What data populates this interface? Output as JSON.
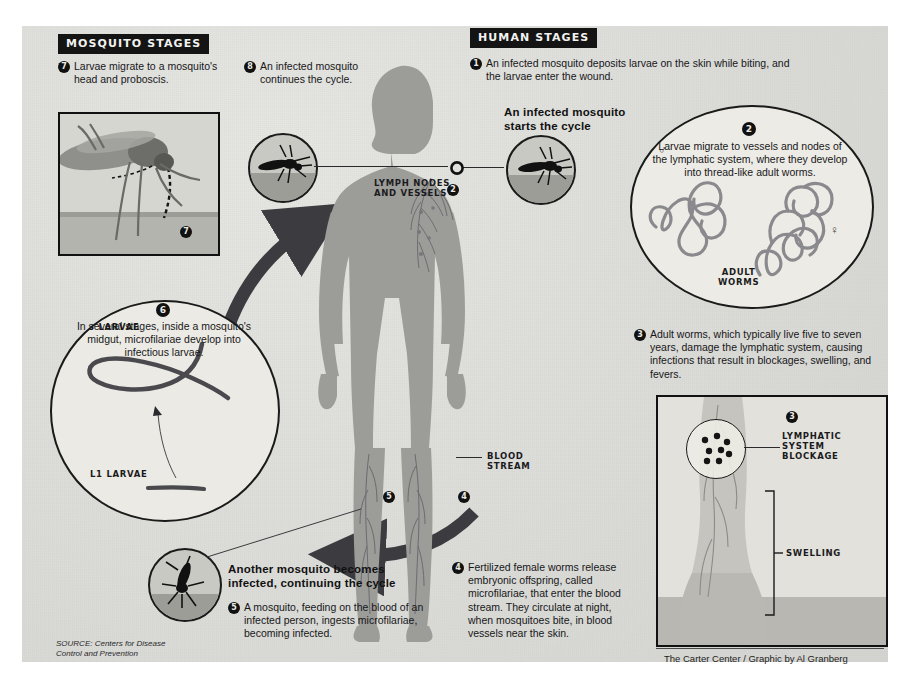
{
  "sections": {
    "mosquito": "MOSQUITO STAGES",
    "human": "HUMAN STAGES"
  },
  "steps": {
    "s1": {
      "num": "1",
      "text": "An infected mosquito deposits larvae on the skin while biting, and the larvae enter the wound."
    },
    "s2": {
      "num": "2",
      "text": "Larvae migrate to vessels and nodes of the lymphatic system, where they develop into thread-like adult worms."
    },
    "s3": {
      "num": "3",
      "text": "Adult worms, which typically live five to seven years, damage the lymphatic system, causing infections that result in blockages, swelling, and fevers."
    },
    "s4": {
      "num": "4",
      "text": "Fertilized female worms release embryonic offspring, called microfilariae, that enter the blood stream. They circulate at night, when mosquitoes bite, in blood vessels near the skin."
    },
    "s5": {
      "num": "5",
      "text": "A mosquito, feeding on the blood of an infected person, ingests microfilariae, becoming infected."
    },
    "s6": {
      "num": "6",
      "text": "In several stages, inside a mosquito's midgut, microfilariae develop into infectious larvae."
    },
    "s7": {
      "num": "7",
      "text": "Larvae migrate to a mosquito's head and proboscis."
    },
    "s8": {
      "num": "8",
      "text": "An infected mosquito continues the cycle."
    }
  },
  "callouts": {
    "start": "An infected mosquito\nstarts the cycle",
    "another": "Another mosquito becomes\ninfected, continuing the cycle"
  },
  "labels": {
    "lymph_nodes": "LYMPH NODES\nAND VESSELS",
    "blood_stream": "BLOOD\nSTREAM",
    "adult_worms": "ADULT\nWORMS",
    "l3_larvae": "L3 LARVAE",
    "l1_larvae": "L1 LARVAE",
    "lymphatic_blockage": "LYMPHATIC\nSYSTEM\nBLOCKAGE",
    "swelling": "SWELLING",
    "male_symbol": "♂",
    "female_symbol": "♀"
  },
  "badges_on_art": {
    "mosquito_photo": "7",
    "lymph_marker": "2",
    "leg_left_marker": "5",
    "leg_right_marker": "4",
    "blockage_marker": "3",
    "shoulder_marker": "1"
  },
  "credits": {
    "source": "SOURCE: Centers for Disease\nControl and Prevention",
    "graphic": "The Carter Center / Graphic by Al Granberg"
  },
  "colors": {
    "paper": "#dededa",
    "ink": "#141414",
    "body_fill": "#9a9a97",
    "arrow": "#3c3c40",
    "circle_fill": "#eceae4"
  }
}
